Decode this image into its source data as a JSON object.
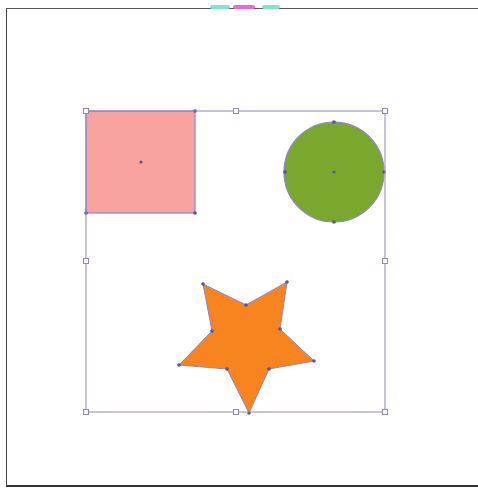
{
  "artboard": {
    "background": "#ffffff",
    "border": "#444444"
  },
  "selection": {
    "color": "#8a86c8",
    "bbox": {
      "x": 86,
      "y": 111,
      "w": 299,
      "h": 301
    },
    "handles": [
      {
        "x": 86,
        "y": 111
      },
      {
        "x": 236,
        "y": 111
      },
      {
        "x": 385,
        "y": 111
      },
      {
        "x": 86,
        "y": 261
      },
      {
        "x": 385,
        "y": 261
      },
      {
        "x": 86,
        "y": 412
      },
      {
        "x": 236,
        "y": 412
      },
      {
        "x": 385,
        "y": 412
      }
    ]
  },
  "shapes": [
    {
      "type": "rect",
      "name": "square",
      "fill": "#f8a3a0",
      "x": 86,
      "y": 111,
      "w": 109,
      "h": 102,
      "anchors": [
        {
          "x": 86,
          "y": 111
        },
        {
          "x": 195,
          "y": 111
        },
        {
          "x": 195,
          "y": 213
        },
        {
          "x": 86,
          "y": 213
        }
      ],
      "center": {
        "x": 141,
        "y": 162
      }
    },
    {
      "type": "circle",
      "name": "circle",
      "fill": "#7aa82e",
      "cx": 334,
      "cy": 172,
      "r": 50,
      "anchors": [
        {
          "x": 334,
          "y": 122
        },
        {
          "x": 384,
          "y": 172
        },
        {
          "x": 334,
          "y": 222
        },
        {
          "x": 285,
          "y": 172
        }
      ],
      "center": {
        "x": 334,
        "y": 172
      }
    },
    {
      "type": "star",
      "name": "star",
      "fill": "#f7841f",
      "points": [
        [
          203,
          284
        ],
        [
          246,
          305
        ],
        [
          287,
          282
        ],
        [
          280,
          329
        ],
        [
          314,
          361
        ],
        [
          269,
          369
        ],
        [
          249,
          413
        ],
        [
          227,
          369
        ],
        [
          179,
          365
        ],
        [
          212,
          331
        ]
      ]
    }
  ],
  "anchor_color": "#5a4fa0"
}
